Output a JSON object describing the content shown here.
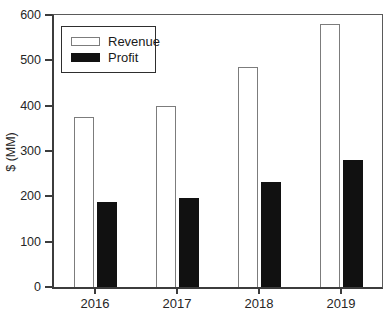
{
  "chart_data": {
    "type": "bar",
    "categories": [
      "2016",
      "2017",
      "2018",
      "2019"
    ],
    "series": [
      {
        "name": "Revenue",
        "values": [
          375,
          400,
          485,
          580
        ],
        "fill": "#ffffff",
        "border": "#7c7c7c"
      },
      {
        "name": "Profit",
        "values": [
          187,
          196,
          232,
          280
        ],
        "fill": "#111111",
        "border": "#111111"
      }
    ],
    "title": "",
    "xlabel": "",
    "ylabel": "$ (MM)",
    "ylim": [
      0,
      600
    ],
    "yticks": [
      0,
      100,
      200,
      300,
      400,
      500,
      600
    ],
    "grid": false,
    "legend_position": "upper-left",
    "axis_color": "#3c3c3c"
  }
}
